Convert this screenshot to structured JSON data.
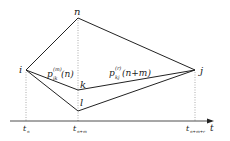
{
  "diagram": {
    "nodes": {
      "i": {
        "label": "i",
        "x": 26,
        "y": 70
      },
      "n": {
        "label": "n",
        "x": 78,
        "y": 18
      },
      "k": {
        "label": "k",
        "x": 78,
        "y": 90
      },
      "l": {
        "label": "l",
        "x": 78,
        "y": 111
      },
      "j": {
        "label": "j",
        "x": 195,
        "y": 70
      }
    },
    "edge_labels": {
      "ik": {
        "main": "p",
        "sup": "(m)",
        "sub": "ik",
        "arg": "(n)"
      },
      "kj": {
        "main": "p",
        "sup": "(r)",
        "sub": "kj",
        "arg": "(n+m)"
      }
    },
    "axis": {
      "label": "t",
      "ticks": [
        {
          "main": "t",
          "sub": "n"
        },
        {
          "main": "t",
          "sub": "n+m"
        },
        {
          "main": "t",
          "sub": "n+m+r"
        }
      ]
    },
    "colors": {
      "line": "#222222",
      "dotted": "#888888"
    }
  }
}
